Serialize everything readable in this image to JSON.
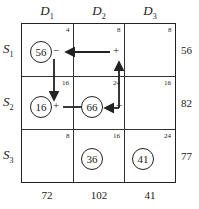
{
  "columns": [
    {
      "label": "D",
      "sub": "1",
      "demand": "72"
    },
    {
      "label": "D",
      "sub": "2",
      "demand": "102"
    },
    {
      "label": "D",
      "sub": "3",
      "demand": "41"
    }
  ],
  "rows": [
    {
      "label": "S",
      "sub": "1",
      "supply": "56"
    },
    {
      "label": "S",
      "sub": "2",
      "supply": "82"
    },
    {
      "label": "S",
      "sub": "3",
      "supply": "77"
    }
  ],
  "costs": [
    [
      "4",
      "8",
      "8"
    ],
    [
      "16",
      "24",
      "16"
    ],
    [
      "8",
      "16",
      "24"
    ]
  ],
  "allocations": {
    "s1d1": "56",
    "s2d1": "16",
    "s2d2": "66",
    "s3d2": "36",
    "s3d3": "41"
  },
  "signs": {
    "s1d1": "−",
    "s1d2": "+",
    "s2d1": "+",
    "s2d2": "−"
  }
}
